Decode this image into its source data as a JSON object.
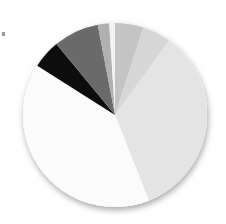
{
  "chart_data": {
    "type": "pie",
    "title": "",
    "legend": "none",
    "center": [
      115,
      115
    ],
    "radius": 92,
    "start_angle_deg": 0,
    "direction": "clockwise",
    "shadow": true,
    "slices": [
      {
        "label": "",
        "value": 5,
        "color": "#c4c4c4"
      },
      {
        "label": "",
        "value": 5,
        "color": "#d6d6d6"
      },
      {
        "label": "",
        "value": 34,
        "color": "#e4e4e4"
      },
      {
        "label": "",
        "value": 40,
        "color": "#fbfbfb"
      },
      {
        "label": "",
        "value": 5,
        "color": "#0a0a0a"
      },
      {
        "label": "",
        "value": 8,
        "color": "#6a6a6a"
      },
      {
        "label": "",
        "value": 2,
        "color": "#b0b0b0"
      },
      {
        "label": "",
        "value": 1,
        "color": "#f2f2f2"
      }
    ]
  }
}
